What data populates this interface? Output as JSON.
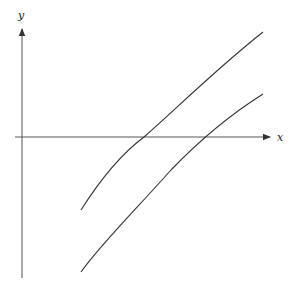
{
  "diagram": {
    "type": "function-graph",
    "axes": {
      "x_label": "x",
      "y_label": "y"
    },
    "curves": [
      {
        "name": "upper-curve",
        "description": "concave increasing curve crossing x-axis left of the lower curve"
      },
      {
        "name": "lower-curve",
        "description": "same curve shifted downward / to the right"
      }
    ],
    "colors": {
      "axis": "#555555",
      "curve": "#333333",
      "background": "#ffffff"
    }
  }
}
